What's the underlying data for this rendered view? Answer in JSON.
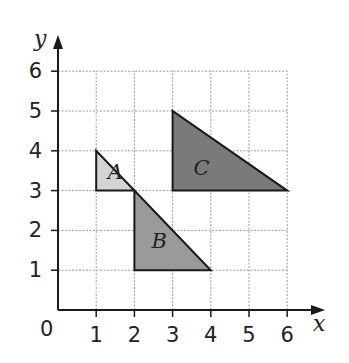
{
  "diagram": {
    "type": "coordinate-grid-with-triangles",
    "axes": {
      "x_label": "x",
      "y_label": "y",
      "origin_label": "0",
      "x_ticks": [
        "1",
        "2",
        "3",
        "4",
        "5",
        "6"
      ],
      "y_ticks": [
        "1",
        "2",
        "3",
        "4",
        "5",
        "6"
      ],
      "x_range": [
        0,
        6
      ],
      "y_range": [
        0,
        6
      ],
      "grid": "dashed"
    },
    "shapes": [
      {
        "label": "A",
        "vertices": [
          [
            1,
            4
          ],
          [
            1,
            3
          ],
          [
            2,
            3
          ]
        ],
        "fill": "#d4d4d4",
        "label_pos": [
          1.3,
          3.3
        ]
      },
      {
        "label": "B",
        "vertices": [
          [
            2,
            3
          ],
          [
            2,
            1
          ],
          [
            4,
            1
          ]
        ],
        "fill": "#9a9a9a",
        "label_pos": [
          2.45,
          1.55
        ]
      },
      {
        "label": "C",
        "vertices": [
          [
            3,
            5
          ],
          [
            3,
            3
          ],
          [
            6,
            3
          ]
        ],
        "fill": "#7a7a7a",
        "label_pos": [
          3.55,
          3.4
        ]
      }
    ],
    "colors": {
      "axis": "#1a1a1a",
      "grid": "#9a9a9a",
      "outline": "#1a1a1a"
    }
  }
}
